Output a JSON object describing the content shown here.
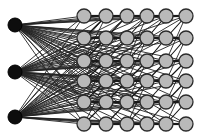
{
  "diagram": {
    "type": "neural-network",
    "background": "#ffffff",
    "input_layer": {
      "color": "#0d0d0d",
      "radius": 7,
      "x": 15,
      "nodes_y": [
        25,
        72,
        117
      ]
    },
    "hidden_grid": {
      "color": "#b9b9b9",
      "stroke": "#2b2b2b",
      "radius": 7,
      "columns_x": [
        84,
        106,
        127,
        147,
        166,
        186
      ],
      "rows_y": [
        16,
        38,
        61,
        81,
        102,
        124
      ]
    },
    "edges": {
      "input_to_first_column": "all-to-all",
      "input_to_all_hidden": "all-to-all",
      "between_columns": "horizontal-and-diagonal"
    }
  }
}
